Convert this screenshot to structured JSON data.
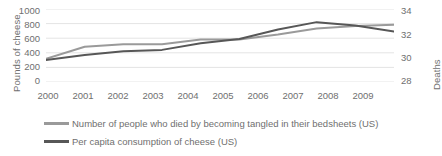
{
  "chart_data": {
    "type": "line",
    "title": "",
    "xlabel": "",
    "categories": [
      "2000",
      "2001",
      "2002",
      "2003",
      "2004",
      "2005",
      "2006",
      "2007",
      "2008",
      "2009"
    ],
    "grid": true,
    "legend_position": "bottom",
    "axes": {
      "left": {
        "label": "Pounds of cheese",
        "ticks": [
          "0",
          "200",
          "400",
          "600",
          "800",
          "1000"
        ],
        "ticks_numeric": [
          0,
          200,
          400,
          600,
          800,
          1000
        ],
        "range": [
          0,
          1000
        ]
      },
      "right": {
        "label": "Deaths",
        "ticks": [
          "28",
          "30",
          "32",
          "34"
        ],
        "ticks_numeric": [
          28,
          30,
          32,
          34
        ],
        "range": [
          28,
          34
        ]
      }
    },
    "series": [
      {
        "name": "Number of people who died by becoming tangled in their bedsheets (US)",
        "axis": "right",
        "color": "#9a9a9a",
        "values": [
          29.9,
          30.9,
          31.1,
          31.1,
          31.5,
          31.5,
          31.9,
          32.4,
          32.6,
          32.7
        ],
        "values_scaled_left_axis": [
          310,
          460,
          480,
          480,
          520,
          570,
          650,
          730,
          770,
          770
        ]
      },
      {
        "name": "Per capita consumption of cheese (US)",
        "axis": "left",
        "color": "#575757",
        "values": [
          300,
          370,
          420,
          440,
          530,
          590,
          720,
          820,
          775,
          690
        ]
      }
    ]
  },
  "legend": [
    {
      "label": "Number of people who died by becoming tangled in their bedsheets (US)",
      "color": "#9a9a9a"
    },
    {
      "label": "Per capita consumption of cheese (US)",
      "color": "#575757"
    }
  ]
}
